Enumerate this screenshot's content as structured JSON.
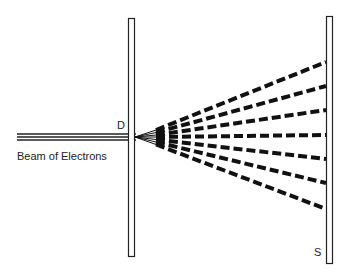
{
  "diagram": {
    "labels": {
      "beam": "Beam of Electrons",
      "slit_barrier": "D",
      "screen": "S"
    },
    "colors": {
      "stroke": "#222222",
      "background": "#ffffff"
    },
    "ray_count": 7
  }
}
